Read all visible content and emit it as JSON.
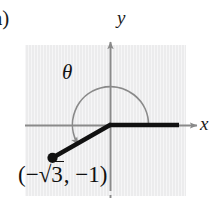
{
  "figure": {
    "part_label": "a)",
    "axes": {
      "y_label": "y",
      "x_label": "x"
    },
    "angle": {
      "symbol": "θ",
      "direction": "counterclockwise",
      "start_degrees": 0,
      "sweep_degrees": 210
    },
    "point": {
      "label_open": "(−",
      "radical_sign": "√",
      "radicand": "3",
      "label_mid": ", −1)",
      "full_label": "(−√3, −1)",
      "x_expression": "−√3",
      "y_expression": "−1"
    },
    "colors": {
      "panel_background": "#ececed",
      "axis_gray": "#8a8a8a",
      "arc_gray": "#8a8a8a",
      "ray_black": "#111111",
      "text_black": "#1a1a1a",
      "page_background": "#ffffff"
    }
  }
}
